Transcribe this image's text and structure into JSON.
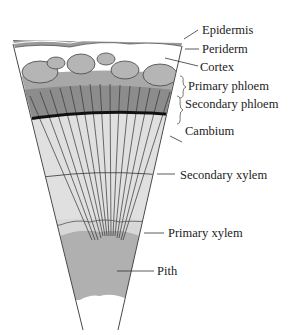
{
  "labels": {
    "epidermis": "Epidermis",
    "periderm": "Periderm",
    "cortex": "Cortex",
    "primary_phloem": "Primary phloem",
    "secondary_phloem": "Secondary phloem",
    "cambium": "Cambium",
    "secondary_xylem": "Secondary xylem",
    "primary_xylem": "Primary xylem",
    "pith": "Pith"
  },
  "colors": {
    "epidermis": "#9a9a9a",
    "cortex_cells": "#b5b5b5",
    "phloem": "#8f8f8f",
    "cambium": "#111111",
    "xylem": "#e2e2e2",
    "pith": "#b0b0b0",
    "lines": "#333333"
  }
}
